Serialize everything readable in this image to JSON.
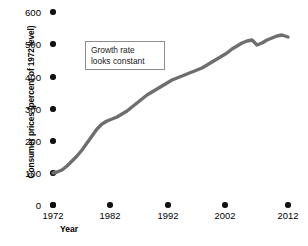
{
  "chart_data": {
    "type": "line",
    "title": "",
    "xlabel": "Year",
    "ylabel": "Consumer prices (percent of 1972 level)",
    "xlim": [
      1972,
      2012
    ],
    "ylim": [
      0,
      600
    ],
    "grid": false,
    "legend": "none",
    "line_color": "#6e6e6e",
    "x_ticks": [
      "1972",
      "1982",
      "1992",
      "2002",
      "2012"
    ],
    "x_tick_values": [
      1972,
      1982,
      1992,
      2002,
      2012
    ],
    "y_ticks": [
      "0",
      "100",
      "200",
      "300",
      "400",
      "500",
      "600"
    ],
    "y_tick_values": [
      0,
      100,
      200,
      300,
      400,
      500,
      600
    ],
    "annotations": [
      {
        "name": "growth-rate-note",
        "line1": "Growth rate",
        "line2": "looks constant"
      }
    ],
    "series": [
      {
        "name": "Consumer prices",
        "x": [
          1972,
          1973,
          1974,
          1975,
          1976,
          1977,
          1978,
          1979,
          1980,
          1981,
          1982,
          1983,
          1984,
          1985,
          1986,
          1987,
          1988,
          1989,
          1990,
          1991,
          1992,
          1993,
          1994,
          1995,
          1996,
          1997,
          1998,
          1999,
          2000,
          2001,
          2002,
          2003,
          2004,
          2005,
          2006,
          2007,
          2008,
          2009,
          2010,
          2011,
          2012
        ],
        "values": [
          100,
          106,
          118,
          129,
          136,
          145,
          156,
          174,
          197,
          217,
          231,
          238,
          249,
          257,
          262,
          272,
          283,
          297,
          313,
          326,
          336,
          346,
          355,
          365,
          376,
          385,
          391,
          399,
          413,
          425,
          431,
          441,
          453,
          468,
          483,
          497,
          516,
          514,
          522,
          538,
          530
        ]
      }
    ],
    "path_points": [
      [
        53,
        173
      ],
      [
        57,
        172
      ],
      [
        62,
        170
      ],
      [
        67,
        166
      ],
      [
        72,
        161
      ],
      [
        77,
        156
      ],
      [
        82,
        150
      ],
      [
        87,
        143
      ],
      [
        92,
        136
      ],
      [
        97,
        129
      ],
      [
        102,
        124
      ],
      [
        107,
        121
      ],
      [
        112,
        119
      ],
      [
        117,
        117
      ],
      [
        122,
        114
      ],
      [
        127,
        111
      ],
      [
        132,
        107
      ],
      [
        137,
        103
      ],
      [
        142,
        99
      ],
      [
        147,
        95
      ],
      [
        152,
        92
      ],
      [
        157,
        89
      ],
      [
        162,
        86
      ],
      [
        167,
        83
      ],
      [
        172,
        80
      ],
      [
        177,
        78
      ],
      [
        182,
        76
      ],
      [
        187,
        74
      ],
      [
        192,
        72
      ],
      [
        197,
        70
      ],
      [
        202,
        68
      ],
      [
        207,
        65
      ],
      [
        212,
        62
      ],
      [
        217,
        59
      ],
      [
        222,
        56
      ],
      [
        227,
        53
      ],
      [
        232,
        49
      ],
      [
        237,
        46
      ],
      [
        242,
        43
      ],
      [
        247,
        41
      ],
      [
        252,
        40
      ],
      [
        257,
        45
      ],
      [
        262,
        43
      ],
      [
        267,
        40
      ],
      [
        272,
        38
      ],
      [
        277,
        36
      ],
      [
        282,
        35
      ],
      [
        288,
        37
      ]
    ]
  },
  "axes": {
    "y_tick_positions": [
      12,
      44,
      77,
      109,
      141,
      173,
      205
    ],
    "x_tick_positions": [
      53,
      110,
      168,
      225,
      288
    ],
    "dot_x": 53,
    "dot_y": 205
  }
}
